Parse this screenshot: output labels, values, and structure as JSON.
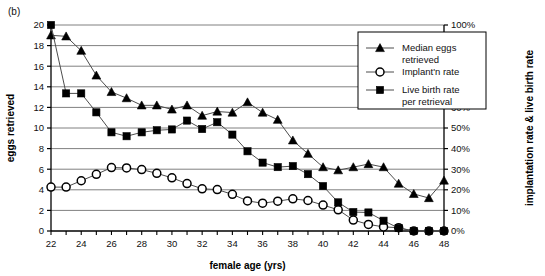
{
  "panel": {
    "label": "(b)"
  },
  "chart_data": {
    "type": "line",
    "title": "",
    "subtitle": "",
    "xlabel": "female age (yrs)",
    "ylabel": "eggs retrieved",
    "y2label": "implantation rate & live birth rate",
    "xlim": [
      22,
      48
    ],
    "ylim": [
      0,
      20
    ],
    "y2lim": [
      0,
      100
    ],
    "grid": true,
    "legend_position": "upper-right-inside",
    "x_tick_step": 2,
    "x_minor_tick_step": 1,
    "y_tick_step": 2,
    "y2_tick_step": 10,
    "xticks": [
      22,
      24,
      26,
      28,
      30,
      32,
      34,
      36,
      38,
      40,
      42,
      44,
      46,
      48
    ],
    "xtick_labels": [
      "22",
      "24",
      "26",
      "28",
      "30",
      "32",
      "34",
      "36",
      "38",
      "40",
      "42",
      "44",
      "46",
      "48"
    ],
    "yticks": [
      0,
      2,
      4,
      6,
      8,
      10,
      12,
      14,
      16,
      18,
      20
    ],
    "ytick_labels": [
      "0",
      "2",
      "4",
      "6",
      "8",
      "10",
      "12",
      "14",
      "16",
      "18",
      "20"
    ],
    "y2ticks": [
      0,
      10,
      20,
      30,
      40,
      50,
      60,
      70,
      80,
      90,
      100
    ],
    "y2tick_labels": [
      "0%",
      "10%",
      "20%",
      "30%",
      "40%",
      "50%",
      "60%",
      "70%",
      "80%",
      "90%",
      "100%"
    ],
    "x": [
      22,
      23,
      24,
      25,
      26,
      27,
      28,
      29,
      30,
      31,
      32,
      33,
      34,
      35,
      36,
      37,
      38,
      39,
      40,
      41,
      42,
      43,
      44,
      45,
      46,
      47,
      48
    ],
    "series": [
      {
        "name": "Median eggs retrieved",
        "marker": "triangle",
        "axis": "left",
        "units": "eggs",
        "values": [
          19.0,
          18.9,
          17.5,
          15.1,
          13.5,
          12.9,
          12.2,
          12.2,
          11.8,
          12.2,
          11.2,
          11.6,
          11.5,
          12.5,
          11.5,
          10.8,
          8.8,
          7.5,
          6.2,
          5.9,
          6.2,
          6.5,
          6.2,
          4.6,
          3.6,
          3.2,
          4.9
        ]
      },
      {
        "name": "Implant'n rate",
        "marker": "circle",
        "axis": "right",
        "units": "percent",
        "values": [
          21.3,
          21.3,
          24.4,
          27.5,
          30.8,
          30.6,
          29.8,
          28.0,
          25.8,
          23.0,
          20.5,
          20.1,
          17.8,
          14.6,
          13.5,
          14.5,
          15.6,
          14.8,
          12.6,
          10.3,
          5.3,
          3.2,
          2.0,
          1.6,
          0.0,
          0.0,
          0.0
        ]
      },
      {
        "name": "Live birth rate per retrieval",
        "marker": "square",
        "axis": "right",
        "units": "percent",
        "values": [
          100.0,
          66.8,
          66.8,
          57.6,
          47.9,
          46.0,
          47.9,
          48.9,
          49.3,
          53.6,
          49.5,
          52.8,
          46.8,
          38.7,
          33.2,
          31.0,
          31.5,
          27.6,
          21.8,
          13.9,
          9.2,
          9.0,
          5.0,
          1.4,
          0.0,
          0.0,
          0.0
        ]
      }
    ],
    "legend": [
      {
        "label_line1": "Median eggs",
        "label_line2": "retrieved",
        "marker": "triangle"
      },
      {
        "label_line1": "Implant'n rate",
        "label_line2": "",
        "marker": "circle"
      },
      {
        "label_line1": "Live birth rate",
        "label_line2": "per retrieval",
        "marker": "square"
      }
    ],
    "colors": {
      "line": "#4d4d4d",
      "marker": "#000000",
      "grid": "#808080",
      "axis": "#000000",
      "background": "#ffffff"
    }
  }
}
